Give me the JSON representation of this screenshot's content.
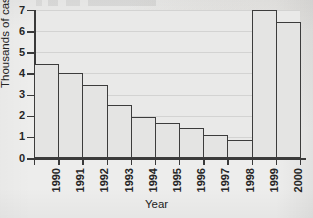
{
  "chart_data": {
    "type": "bar",
    "title": "",
    "xlabel": "Year",
    "ylabel": "Thousands of cases",
    "categories": [
      "1990",
      "1991",
      "1992",
      "1993",
      "1994",
      "1995",
      "1996",
      "1997",
      "1998",
      "1999",
      "2000"
    ],
    "values": [
      4.45,
      4.0,
      3.45,
      2.5,
      1.95,
      1.65,
      1.4,
      1.1,
      0.85,
      7.0,
      6.45
    ],
    "ylim": [
      0,
      7
    ],
    "yticks": [
      0,
      1,
      2,
      3,
      4,
      5,
      6,
      7
    ],
    "ytick_labels": [
      "0",
      "1",
      "2",
      "3",
      "4",
      "5",
      "6",
      "7"
    ],
    "grid": true,
    "grid_axis": "y",
    "legend": "none",
    "bar_gap": 0,
    "series": [
      {
        "name": "Thousands of cases",
        "values": [
          4.45,
          4.0,
          3.45,
          2.5,
          1.95,
          1.65,
          1.4,
          1.1,
          0.85,
          7.0,
          6.45
        ]
      }
    ]
  },
  "style": {
    "background": "#ededec",
    "plot_background": "#e9e9e8",
    "bar_fill": "#e4e4e3",
    "bar_outline": "#3c3c3c",
    "axis_color": "#3a3a3a",
    "text_color": "#262626",
    "grid_color": "#b6b6b6"
  }
}
